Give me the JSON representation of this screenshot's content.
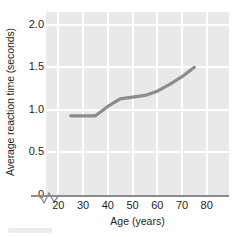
{
  "chart_data": {
    "type": "line",
    "title": "",
    "xlabel": "Age (years)",
    "ylabel": "Average reaction time (seconds)",
    "xlim": [
      15,
      89
    ],
    "ylim": [
      0,
      2.15
    ],
    "xticks": [
      "20",
      "30",
      "40",
      "50",
      "60",
      "70",
      "80"
    ],
    "xtick_values": [
      20,
      30,
      40,
      50,
      60,
      70,
      80
    ],
    "yticks": [
      "0",
      "0.5",
      "1.0",
      "1.5",
      "2.0"
    ],
    "ytick_values": [
      0,
      0.5,
      1.0,
      1.5,
      2.0
    ],
    "grid": "white gridlines on gray panel",
    "legend": "none",
    "axis_break": "zigzag break on x-axis between 0 and 20",
    "series": [
      {
        "name": "Average reaction time",
        "color": "#8c8c8c",
        "x": [
          25,
          30,
          35,
          40,
          45,
          50,
          55,
          60,
          65,
          70,
          75
        ],
        "values": [
          0.93,
          0.93,
          0.93,
          1.04,
          1.13,
          1.15,
          1.17,
          1.22,
          1.3,
          1.39,
          1.5
        ]
      }
    ]
  },
  "axes": {
    "x_title": "Age (years)",
    "y_title": "Average reaction time (seconds)"
  },
  "colors": {
    "panel": "#e9e9e9",
    "grid": "#ffffff",
    "line": "#8c8c8c",
    "axis": "#8c8c8c",
    "text": "#231f20"
  }
}
